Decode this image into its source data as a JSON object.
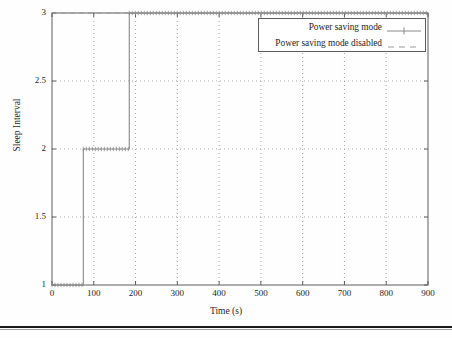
{
  "chart_data": {
    "type": "line",
    "title": "",
    "xlabel": "Time (s)",
    "ylabel": "Sleep Interval",
    "xlim": [
      0,
      900
    ],
    "ylim": [
      1,
      3
    ],
    "xticks": [
      0,
      100,
      200,
      300,
      400,
      500,
      600,
      700,
      800,
      900
    ],
    "xticklabels": [
      "0",
      "100",
      "200",
      "300",
      "400",
      "500",
      "600",
      "700",
      "800",
      "900"
    ],
    "yticks": [
      1,
      1.5,
      2,
      2.5,
      3
    ],
    "yticklabels": [
      "1",
      "1.5",
      "2",
      "2.5",
      "3"
    ],
    "grid": true,
    "grid_style": "dotted",
    "legend_position": "upper right",
    "series": [
      {
        "name": "Power saving mode",
        "style": "solid-with-markers",
        "color": "#8a8a8a",
        "step": "post",
        "x": [
          0,
          75,
          75,
          185,
          185,
          900
        ],
        "y": [
          1,
          1,
          2,
          2,
          3,
          3
        ],
        "points": [
          {
            "x": 0,
            "y": 1
          },
          {
            "x": 75,
            "y": 1
          },
          {
            "x": 75,
            "y": 2
          },
          {
            "x": 185,
            "y": 2
          },
          {
            "x": 185,
            "y": 3
          },
          {
            "x": 900,
            "y": 3
          }
        ]
      },
      {
        "name": "Power saving mode disabled",
        "style": "dashed",
        "color": "#9a9a9a",
        "step": "post",
        "x": [
          0,
          900
        ],
        "y": [
          3,
          3
        ],
        "points": [
          {
            "x": 0,
            "y": 3
          },
          {
            "x": 900,
            "y": 3
          }
        ]
      }
    ],
    "annotations": []
  },
  "legend": {
    "entries": [
      {
        "label": "Power saving mode",
        "sample": "solid-line-with-plus-marker"
      },
      {
        "label": "Power saving mode disabled",
        "sample": "dashed-line"
      }
    ]
  },
  "axes": {
    "x_label": "Time (s)",
    "y_label": "Sleep Interval"
  },
  "colors": {
    "plot_frame": "#5c5c5c",
    "grid": "#9f9f9f",
    "series_1": "#8a8a8a",
    "series_2": "#9a9a9a",
    "text": "#1d1d1d",
    "page_rule": "#1a1a1a",
    "background": "#fefefe"
  },
  "page_rule": {
    "name": "page-bottom-rule"
  }
}
